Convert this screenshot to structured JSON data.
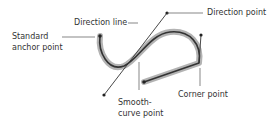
{
  "diagram": {
    "labels": {
      "direction_line": "Direction line",
      "direction_point": "Direction point",
      "standard_anchor_line1": "Standard",
      "standard_anchor_line2": "anchor point",
      "smooth_curve_line1": "Smooth-",
      "smooth_curve_line2": "curve point",
      "corner_point": "Corner point"
    },
    "colors": {
      "text": "#333333",
      "path_stroke": "#333333",
      "path_halo": "#9a9a9a",
      "leader_line": "#555555",
      "background": "#ffffff"
    }
  }
}
